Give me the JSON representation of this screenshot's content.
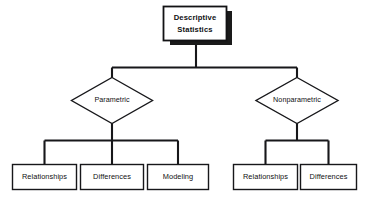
{
  "diagram": {
    "type": "hierarchy-flowchart",
    "title": "Descriptive Statistics",
    "background_color": "#ffffff",
    "line_color": "#17171a",
    "shadow_color": "#1a1a1a",
    "root": {
      "label_line_1": "Descriptive",
      "label_line_2": "Statistics",
      "shape": "rectangle-shadowed"
    },
    "branches": [
      {
        "label": "Parametric",
        "shape": "diamond",
        "children": [
          {
            "label": "Relationships",
            "shape": "rectangle"
          },
          {
            "label": "Differences",
            "shape": "rectangle"
          },
          {
            "label": "Modeling",
            "shape": "rectangle"
          }
        ]
      },
      {
        "label": "Nonparametric",
        "shape": "diamond",
        "children": [
          {
            "label": "Relationships",
            "shape": "rectangle"
          },
          {
            "label": "Differences",
            "shape": "rectangle"
          }
        ]
      }
    ]
  }
}
